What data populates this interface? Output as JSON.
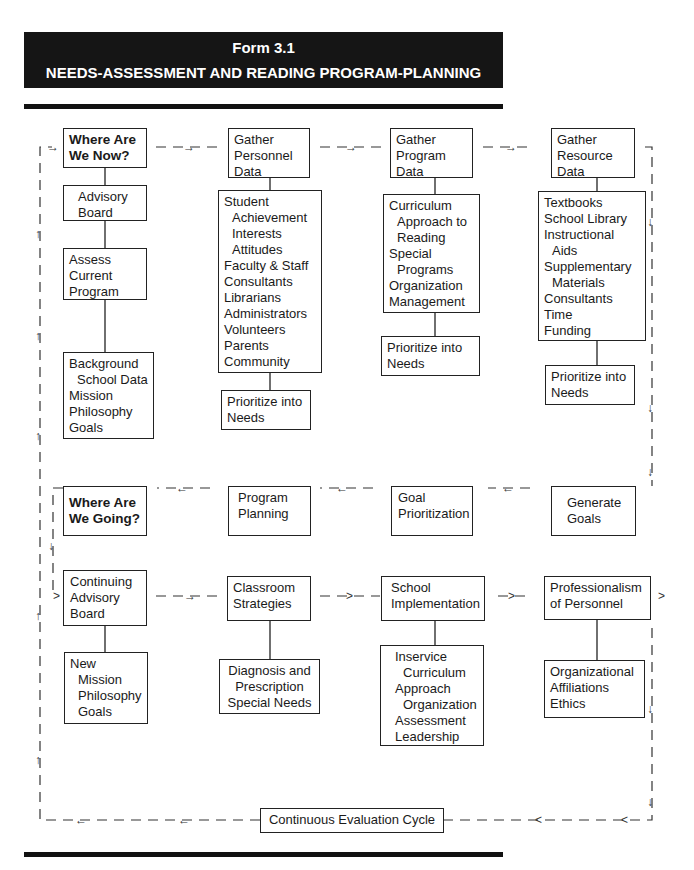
{
  "header": {
    "form_number": "Form 3.1",
    "form_title": "NEEDS-ASSESSMENT AND READING PROGRAM-PLANNING"
  },
  "phases": {
    "where_now": {
      "title_line1": "Where Are",
      "title_line2": "We Now?"
    },
    "where_going": {
      "title_line1": "Where Are",
      "title_line2": "We Going?"
    }
  },
  "boxes": {
    "advisory_board": [
      "Advisory",
      "Board"
    ],
    "assess_current": [
      "Assess",
      "Current",
      "Program"
    ],
    "background": [
      "Background",
      "School Data",
      "Mission",
      "Philosophy",
      "Goals"
    ],
    "gather_personnel": [
      "Gather",
      "Personnel",
      "Data"
    ],
    "personnel_list": [
      "Student",
      "Achievement",
      "Interests",
      "Attitudes",
      "Faculty & Staff",
      "Consultants",
      "Librarians",
      "Administrators",
      "Volunteers",
      "Parents",
      "Community"
    ],
    "personnel_prioritize": [
      "Prioritize into",
      "Needs"
    ],
    "gather_program": [
      "Gather",
      "Program",
      "Data"
    ],
    "program_list": [
      "Curriculum",
      "Approach to",
      "Reading",
      "Special",
      "Programs",
      "Organization",
      "Management"
    ],
    "program_prioritize": [
      "Prioritize into",
      "Needs"
    ],
    "gather_resource": [
      "Gather",
      "Resource",
      "Data"
    ],
    "resource_list": [
      "Textbooks",
      "School Library",
      "Instructional",
      "Aids",
      "Supplementary",
      "Materials",
      "Consultants",
      "Time",
      "Funding"
    ],
    "resource_prioritize": [
      "Prioritize into",
      "Needs"
    ],
    "program_planning": [
      "Program",
      "Planning"
    ],
    "goal_prioritization": [
      "Goal",
      "Prioritization"
    ],
    "generate_goals": [
      "Generate",
      "Goals"
    ],
    "continuing_advisory": [
      "Continuing",
      "Advisory",
      "Board"
    ],
    "new_mission": [
      "New",
      "Mission",
      "Philosophy",
      "Goals"
    ],
    "classroom_strategies": [
      "Classroom",
      "Strategies"
    ],
    "diagnosis": [
      "Diagnosis and",
      "Prescription",
      "Special Needs"
    ],
    "school_implementation": [
      "School",
      "Implementation"
    ],
    "inservice": [
      "Inservice",
      "Curriculum",
      "Approach",
      "Organization",
      "Assessment",
      "Leadership"
    ],
    "professionalism": [
      "Professionalism",
      "of Personnel"
    ],
    "organizational": [
      "Organizational",
      "Affiliations",
      "Ethics"
    ],
    "continuous_evaluation": [
      "Continuous Evaluation Cycle"
    ]
  },
  "colors": {
    "ink": "#1a1a1a",
    "banner_bg": "#151515",
    "banner_text": "#ffffff",
    "paper": "#ffffff"
  }
}
